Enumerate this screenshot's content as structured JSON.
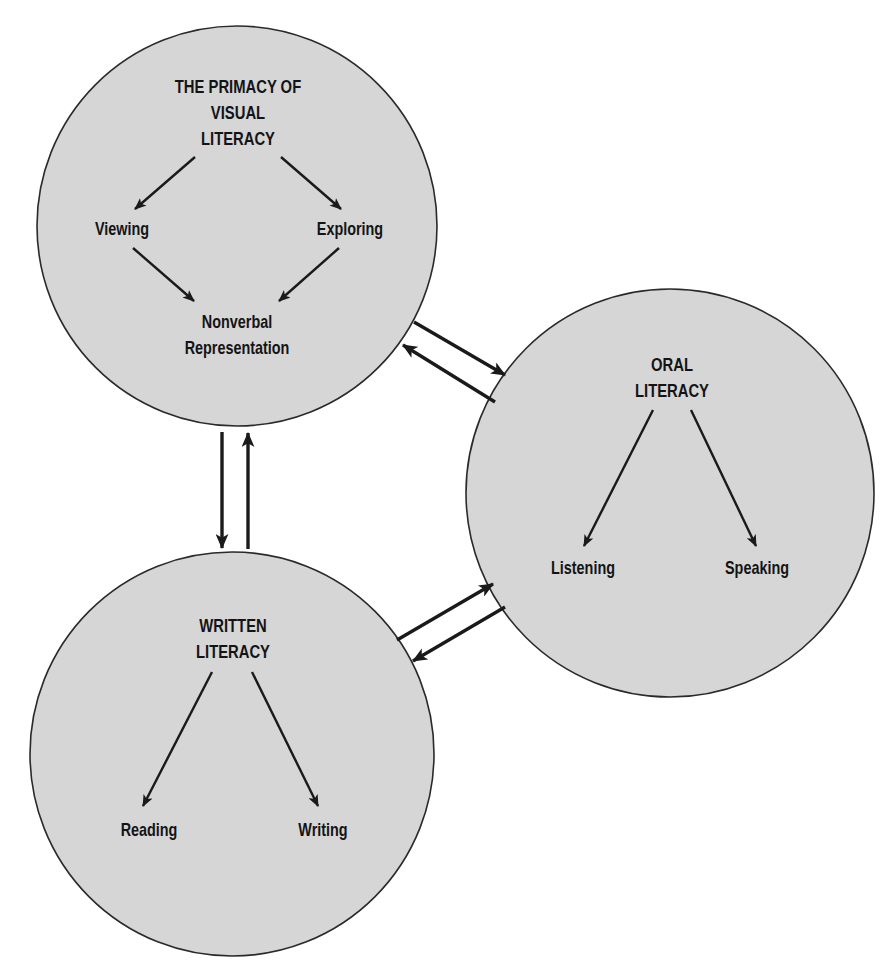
{
  "diagram": {
    "colors": {
      "circle_fill": "#d6d6d6",
      "circle_stroke": "#2a2a2a",
      "arrow": "#1a1a1a",
      "text": "#141414",
      "background": "#ffffff"
    },
    "visual_literacy": {
      "title_lines": [
        "THE PRIMACY OF",
        "VISUAL",
        "LITERACY"
      ],
      "nodes": {
        "viewing": "Viewing",
        "exploring": "Exploring",
        "nonverbal_line1": "Nonverbal",
        "nonverbal_line2": "Representation"
      }
    },
    "oral_literacy": {
      "title_lines": [
        "ORAL",
        "LITERACY"
      ],
      "nodes": {
        "listening": "Listening",
        "speaking": "Speaking"
      }
    },
    "written_literacy": {
      "title_lines": [
        "WRITTEN",
        "LITERACY"
      ],
      "nodes": {
        "reading": "Reading",
        "writing": "Writing"
      }
    },
    "connections": [
      {
        "from": "visual_literacy",
        "to": "oral_literacy"
      },
      {
        "from": "oral_literacy",
        "to": "visual_literacy"
      },
      {
        "from": "visual_literacy",
        "to": "written_literacy"
      },
      {
        "from": "written_literacy",
        "to": "visual_literacy"
      },
      {
        "from": "written_literacy",
        "to": "oral_literacy"
      },
      {
        "from": "oral_literacy",
        "to": "written_literacy"
      }
    ]
  }
}
